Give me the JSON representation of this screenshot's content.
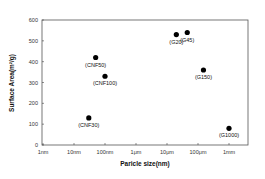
{
  "chart_data": {
    "type": "scatter",
    "title": "",
    "xlabel": "Paricle size(nm)",
    "ylabel": "Surface Area(m²/g)",
    "xscale": "log",
    "x_tick_labels": [
      "1nm",
      "10nm",
      "100nm",
      "1μm",
      "10μm",
      "100μm",
      "1mm"
    ],
    "x_tick_values_nm": [
      1,
      10,
      100,
      1000,
      10000,
      100000,
      1000000
    ],
    "y_tick_labels": [
      "0",
      "100",
      "200",
      "300",
      "400",
      "500",
      "600"
    ],
    "ylim": [
      0,
      600
    ],
    "xlim_nm": [
      1,
      4000000
    ],
    "grid": false,
    "legend": null,
    "points": [
      {
        "label": "(CNF30)",
        "x_nm": 30,
        "y": 130
      },
      {
        "label": "(CNF50)",
        "x_nm": 50,
        "y": 420
      },
      {
        "label": "(CNF100)",
        "x_nm": 100,
        "y": 330
      },
      {
        "label": "(G20)",
        "x_nm": 20000,
        "y": 530
      },
      {
        "label": "(G45)",
        "x_nm": 45000,
        "y": 540
      },
      {
        "label": "(G150)",
        "x_nm": 150000,
        "y": 360
      },
      {
        "label": "(G1000)",
        "x_nm": 1000000,
        "y": 80
      }
    ]
  },
  "colors": {
    "marker": "#000000",
    "axis": "#444444",
    "frame": "#555555"
  }
}
